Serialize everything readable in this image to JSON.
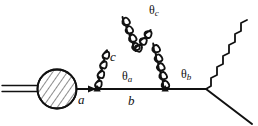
{
  "figure": {
    "kind": "feynman-diagram",
    "background_color": "#ffffff",
    "ink_color": "#111111"
  },
  "labels": {
    "parton_a": "a",
    "parton_b": "b",
    "gluon_c": "c",
    "angle_a": "θ",
    "angle_a_sub": "a",
    "angle_b": "θ",
    "angle_b_sub": "b",
    "angle_c": "θ",
    "angle_c_sub": "c"
  },
  "elements": {
    "blob": {
      "name": "hadron-blob",
      "cx": 57,
      "cy": 89,
      "r": 20,
      "fill": "hatched"
    },
    "incoming_double_line": {
      "name": "incoming-double-line",
      "x_start": 2,
      "x_end": 38,
      "y_upper": 86,
      "y_lower": 91
    },
    "main_line": {
      "name": "outgoing-parton-line",
      "x_start": 77,
      "x_end": 207,
      "y": 89
    },
    "vertex_a": {
      "x": 97,
      "y": 89
    },
    "vertex_b": {
      "x": 165,
      "y": 89
    },
    "vertex_split_c": {
      "x": 136,
      "y": 51
    },
    "vertex_right": {
      "x": 207,
      "y": 89
    },
    "gluon_c": {
      "x1": 97,
      "y1": 89,
      "x2": 136,
      "y2": 51
    },
    "gluon_c1": {
      "x1": 136,
      "y1": 51,
      "x2": 122,
      "y2": 8
    },
    "gluon_c2": {
      "x1": 136,
      "y1": 51,
      "x2": 163,
      "y2": 22
    },
    "gluon_b": {
      "x1": 165,
      "y1": 89,
      "x2": 186,
      "y2": 24
    },
    "photon": {
      "x1": 207,
      "y1": 89,
      "x2": 246,
      "y2": 21
    },
    "final_line": {
      "x1": 207,
      "y1": 89,
      "x2": 252,
      "y2": 124
    }
  }
}
